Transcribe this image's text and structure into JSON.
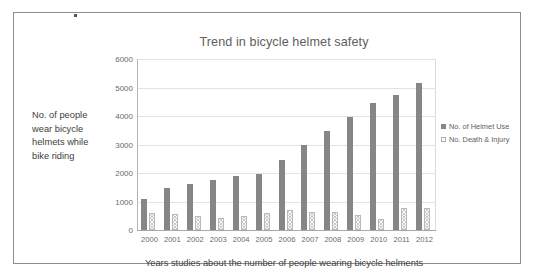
{
  "figure": {
    "y_axis_caption_lines": [
      "No. of people",
      "wear bicycle",
      "helmets while",
      "bike riding"
    ],
    "x_axis_caption": "Years studies about the number of people wearing bicycle helments"
  },
  "chart_data": {
    "type": "bar",
    "title": "Trend in bicycle helmet safety",
    "xlabel": "Years studies about the number of people wearing bicycle helments",
    "ylabel": "No. of people wear bicycle helmets while bike riding",
    "categories": [
      "2000",
      "2001",
      "2002",
      "2003",
      "2004",
      "2005",
      "2006",
      "2007",
      "2008",
      "2009",
      "2010",
      "2011",
      "2012"
    ],
    "series": [
      {
        "name": "No. of Helmet Use",
        "color": "#868686",
        "values": [
          1080,
          1470,
          1620,
          1770,
          1880,
          1980,
          2470,
          2980,
          3470,
          3980,
          4470,
          4720,
          5150
        ]
      },
      {
        "name": "No. Death & Injury",
        "color": "#fbfbfb",
        "values": [
          580,
          560,
          480,
          420,
          480,
          580,
          690,
          630,
          620,
          520,
          390,
          790,
          780
        ]
      }
    ],
    "ylim": [
      0,
      6000
    ],
    "yticks": [
      0,
      1000,
      2000,
      3000,
      4000,
      5000,
      6000
    ],
    "ytick_labels": [
      "0",
      "1000",
      "2000",
      "3000",
      "4000",
      "5000",
      "6000"
    ],
    "grid": true,
    "legend_position": "right"
  }
}
